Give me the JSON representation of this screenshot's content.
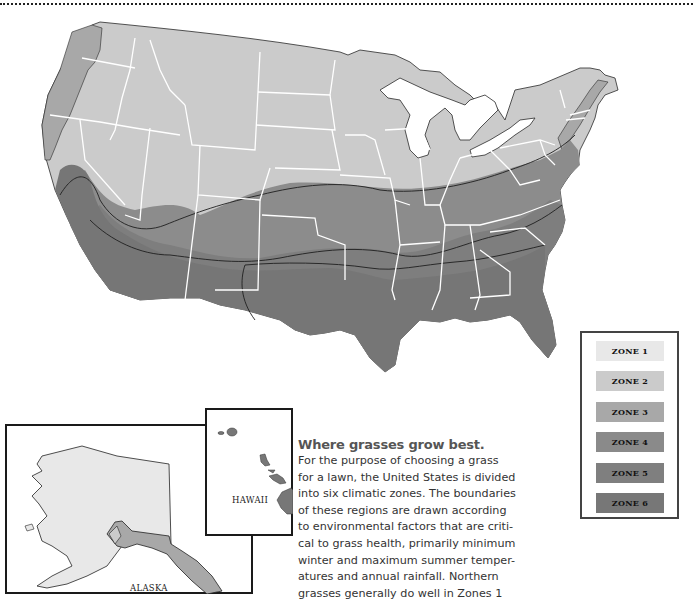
{
  "header": {
    "rule": "dotted-separator"
  },
  "map": {
    "title": "US Grass Climate Zones",
    "colors": {
      "zone1": "#e8e8e8",
      "zone2": "#cbcbcb",
      "zone3": "#a8a8a8",
      "zone4": "#8c8c8c",
      "zone5": "#7e7e7e",
      "zone6": "#767676",
      "state_border": "#ffffff",
      "zone_border": "#1f1f1f"
    }
  },
  "legend": {
    "items": [
      {
        "label": "ZONE 1",
        "color": "#e8e8e8"
      },
      {
        "label": "ZONE 2",
        "color": "#cbcbcb"
      },
      {
        "label": "ZONE 3",
        "color": "#a8a8a8"
      },
      {
        "label": "ZONE 4",
        "color": "#8a8a8a"
      },
      {
        "label": "ZONE 5",
        "color": "#7f7f7f"
      },
      {
        "label": "ZONE 6",
        "color": "#777777"
      }
    ]
  },
  "insets": {
    "hawaii": {
      "label": "HAWAII"
    },
    "alaska": {
      "label": "ALASKA"
    }
  },
  "caption": {
    "title": "Where grasses grow best.",
    "lines": [
      "For the purpose of choosing a grass",
      "for a lawn, the United States is divided",
      "into six climatic zones. The boundaries",
      "of these regions are drawn according",
      "to environmental factors that are criti-",
      "cal to grass health, primarily minimum",
      "winter and maximum summer temper-",
      "atures and annual rainfall. Northern",
      "grasses generally do well in Zones 1"
    ]
  }
}
